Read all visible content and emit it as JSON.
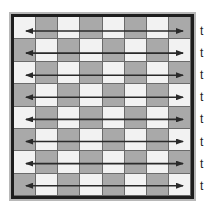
{
  "diagram": {
    "grid": {
      "rows": 8,
      "cols": 8,
      "pattern": "checkerboard",
      "colors": {
        "light": "#f2f2f2",
        "dark": "#a9a9a9",
        "border": "#1e1e1e"
      }
    },
    "arrows": {
      "count": 8,
      "style": "double-headed horizontal",
      "color": "#2a2a2a"
    },
    "labels": [
      "t",
      "t",
      "t",
      "t",
      "t",
      "t",
      "t",
      "t"
    ]
  }
}
